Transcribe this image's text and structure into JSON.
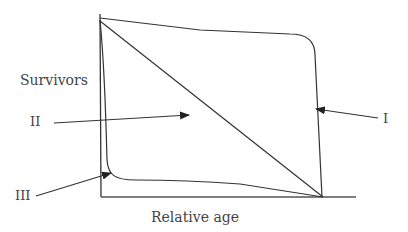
{
  "diagram": {
    "type": "survivorship-curves",
    "y_axis_label": "Survivors",
    "x_axis_label": "Relative age",
    "curves": [
      {
        "id": "I",
        "label": "I",
        "shape": "convex - high survival until old age, then sharp drop"
      },
      {
        "id": "II",
        "label": "II",
        "shape": "straight diagonal - constant mortality"
      },
      {
        "id": "III",
        "label": "III",
        "shape": "concave - high early mortality"
      }
    ],
    "line_color": "#333333",
    "background": "#ffffff"
  }
}
